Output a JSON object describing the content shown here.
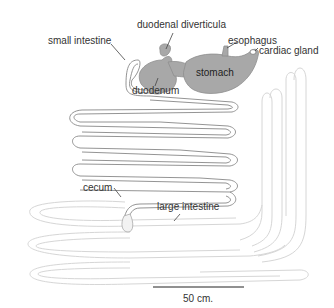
{
  "diagram": {
    "type": "anatomical-diagram",
    "labels": {
      "duodenal_diverticula": "duodenal diverticula",
      "esophagus": "esophagus",
      "cardiac_gland": "cardiac gland",
      "small_intestine": "small intestine",
      "duodenum": "duodenum",
      "stomach": "stomach",
      "cecum": "cecum",
      "large_intestine": "large intestine"
    },
    "scale_bar": {
      "label": "50 cm."
    },
    "colors": {
      "organ_fill": "#a8a8a8",
      "small_intestine_stroke": "#8a8a8a",
      "large_intestine_stroke": "#d4d4d4",
      "leader_line": "#444444",
      "scale_bar": "#222222"
    }
  }
}
